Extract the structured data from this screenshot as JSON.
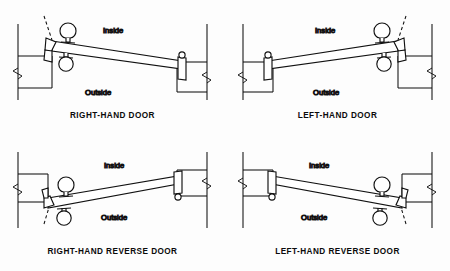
{
  "diagram": {
    "background_color": "#fdfdfd",
    "line_color": "#111111",
    "labels": {
      "inside": "Inside",
      "outside": "Outside"
    },
    "panels": [
      {
        "id": "right-hand-door",
        "caption": "RIGHT-HAND DOOR",
        "inside_label": "Inside",
        "outside_label": "Outside",
        "hinge_side": "left",
        "swing": "inward",
        "position": "top-left"
      },
      {
        "id": "left-hand-door",
        "caption": "LEFT-HAND DOOR",
        "inside_label": "Inside",
        "outside_label": "Outside",
        "hinge_side": "right",
        "swing": "inward",
        "position": "top-right"
      },
      {
        "id": "right-hand-reverse-door",
        "caption": "RIGHT-HAND REVERSE DOOR",
        "inside_label": "Inside",
        "outside_label": "Outside",
        "hinge_side": "left",
        "swing": "outward",
        "position": "bottom-left"
      },
      {
        "id": "left-hand-reverse-door",
        "caption": "LEFT-HAND REVERSE DOOR",
        "inside_label": "Inside",
        "outside_label": "Outside",
        "hinge_side": "right",
        "swing": "outward",
        "position": "bottom-right"
      }
    ]
  }
}
